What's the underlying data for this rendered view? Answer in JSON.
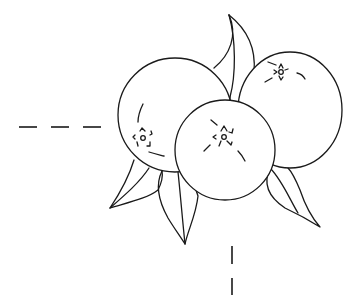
{
  "illustration": {
    "subject": "three oranges with leaves",
    "style": "black line art outline",
    "colors": {
      "background": "#ffffff",
      "stroke": "#1a1a1a"
    },
    "oranges": [
      {
        "name": "left-orange",
        "cx": 175,
        "cy": 115,
        "r": 57
      },
      {
        "name": "right-orange",
        "cx": 290,
        "cy": 110,
        "rx": 52,
        "ry": 58
      },
      {
        "name": "front-orange",
        "cx": 225,
        "cy": 152,
        "r": 50
      }
    ],
    "guides": {
      "horizontal_dashes": [
        [
          19,
          37
        ],
        [
          51,
          69
        ],
        [
          83,
          101
        ]
      ],
      "horizontal_y": 127,
      "vertical_dashes": [
        [
          246,
          264
        ],
        [
          278,
          295
        ]
      ],
      "vertical_x": 232
    }
  }
}
